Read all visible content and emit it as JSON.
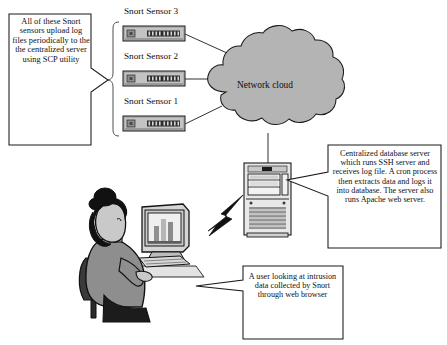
{
  "diagram": {
    "background_color": "#ffffff",
    "line_color": "#1a1a1a",
    "cloud_fill": "#b4b4b4",
    "device_fill": "#b0b0b0"
  },
  "callouts": {
    "left": {
      "text": "All of these Snort sensors upload log files periodically to the the centralized server using SCP utility",
      "pointer_direction": "right"
    },
    "right": {
      "text": "Centralized database server which runs SSH server and receives log file. A cron process then extracts data and logs it into database. The server also runs Apache web server.",
      "pointer_direction": "left"
    },
    "bottom": {
      "text": "A user looking at intrusion data collected by Snort through web browser",
      "pointer_direction": "left"
    }
  },
  "sensors": [
    {
      "label": "Snort Sensor 3"
    },
    {
      "label": "Snort Sensor 2"
    },
    {
      "label": "Snort Sensor 1"
    }
  ],
  "cloud": {
    "label": "Network cloud"
  },
  "nodes": {
    "server": {
      "name": "centralized-database-server"
    },
    "workstation": {
      "name": "user-workstation"
    },
    "user": {
      "name": "seated-user"
    },
    "wireless_link": {
      "name": "lightning-bolt-link"
    }
  }
}
